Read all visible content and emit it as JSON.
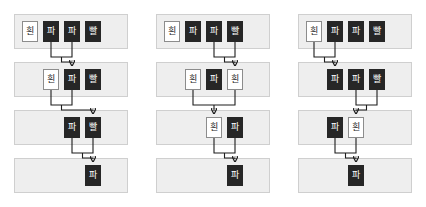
{
  "diagram": {
    "type": "merge-steps",
    "title": "",
    "colors": {
      "tile_dark_bg": "#262626",
      "tile_dark_fg": "#ffffff",
      "tile_light_bg": "#ffffff",
      "tile_light_fg": "#1a1a1a",
      "row_strip_bg": "#eeeeee",
      "row_strip_border": "#cfcfcf",
      "connector": "#1d1d1d",
      "page_bg": "#ffffff"
    },
    "labels": {
      "white": "흰",
      "blue": "파",
      "red": "빨"
    },
    "panels": [
      {
        "name": "panel-1",
        "rows": [
          {
            "tiles": [
              {
                "label": "흰",
                "style": "light"
              },
              {
                "label": "파",
                "style": "dark"
              },
              {
                "label": "파",
                "style": "dark"
              },
              {
                "label": "빨",
                "style": "dark"
              }
            ],
            "merge": [
              1,
              2
            ]
          },
          {
            "tiles": [
              {
                "label": "흰",
                "style": "light"
              },
              {
                "label": "파",
                "style": "dark"
              },
              {
                "label": "빨",
                "style": "dark"
              }
            ],
            "merge": [
              0,
              1
            ]
          },
          {
            "tiles": [
              {
                "label": "파",
                "style": "dark"
              },
              {
                "label": "빨",
                "style": "dark"
              }
            ],
            "merge": [
              0,
              1
            ]
          },
          {
            "tiles": [
              {
                "label": "파",
                "style": "dark"
              }
            ],
            "merge": null
          }
        ]
      },
      {
        "name": "panel-2",
        "rows": [
          {
            "tiles": [
              {
                "label": "흰",
                "style": "light"
              },
              {
                "label": "파",
                "style": "dark"
              },
              {
                "label": "파",
                "style": "dark"
              },
              {
                "label": "빨",
                "style": "dark"
              }
            ],
            "merge": [
              2,
              3
            ]
          },
          {
            "tiles": [
              {
                "label": "흰",
                "style": "light"
              },
              {
                "label": "파",
                "style": "dark"
              },
              {
                "label": "흰",
                "style": "light"
              }
            ],
            "merge": [
              0,
              2
            ]
          },
          {
            "tiles": [
              {
                "label": "흰",
                "style": "light"
              },
              {
                "label": "파",
                "style": "dark"
              }
            ],
            "merge": [
              0,
              1
            ]
          },
          {
            "tiles": [
              {
                "label": "파",
                "style": "dark"
              }
            ],
            "merge": null
          }
        ]
      },
      {
        "name": "panel-3",
        "rows": [
          {
            "tiles": [
              {
                "label": "흰",
                "style": "light"
              },
              {
                "label": "파",
                "style": "dark"
              },
              {
                "label": "파",
                "style": "dark"
              },
              {
                "label": "빨",
                "style": "dark"
              }
            ],
            "merge": [
              0,
              1
            ]
          },
          {
            "tiles": [
              {
                "label": "파",
                "style": "dark"
              },
              {
                "label": "파",
                "style": "dark"
              },
              {
                "label": "빨",
                "style": "dark"
              }
            ],
            "merge": [
              1,
              2
            ]
          },
          {
            "tiles": [
              {
                "label": "파",
                "style": "dark"
              },
              {
                "label": "흰",
                "style": "light"
              }
            ],
            "merge": [
              0,
              1
            ]
          },
          {
            "tiles": [
              {
                "label": "파",
                "style": "dark"
              }
            ],
            "merge": null
          }
        ]
      }
    ]
  }
}
